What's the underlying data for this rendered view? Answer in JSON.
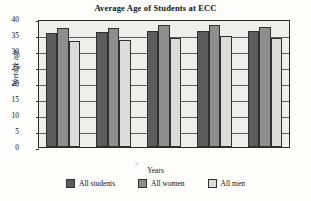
{
  "chart_data": {
    "type": "bar",
    "title": "Average Age of Students at ECC",
    "xlabel": "Years",
    "ylabel": "Average age",
    "categories": [
      "07–08",
      "08–09",
      "09–10",
      "10–11",
      "11–12"
    ],
    "series": [
      {
        "name": "All students",
        "color": "#5c5c5c",
        "values": [
          35.7,
          35.8,
          36.3,
          36.3,
          36.4
        ]
      },
      {
        "name": "All women",
        "color": "#8e8e8e",
        "values": [
          37.2,
          37.3,
          38.1,
          38.1,
          37.4
        ]
      },
      {
        "name": "All men",
        "color": "#dcdcd8",
        "values": [
          33.2,
          33.3,
          34.1,
          34.6,
          34.1
        ]
      }
    ],
    "ylim": [
      0,
      40
    ],
    "yticks": [
      "0",
      "5",
      "10",
      "15",
      "20",
      "25",
      "30",
      "35",
      "40"
    ],
    "grid": true,
    "legend_position": "bottom",
    "plot_background": "#eeeeea",
    "annotations": {
      "stray_mark": "˅"
    }
  }
}
